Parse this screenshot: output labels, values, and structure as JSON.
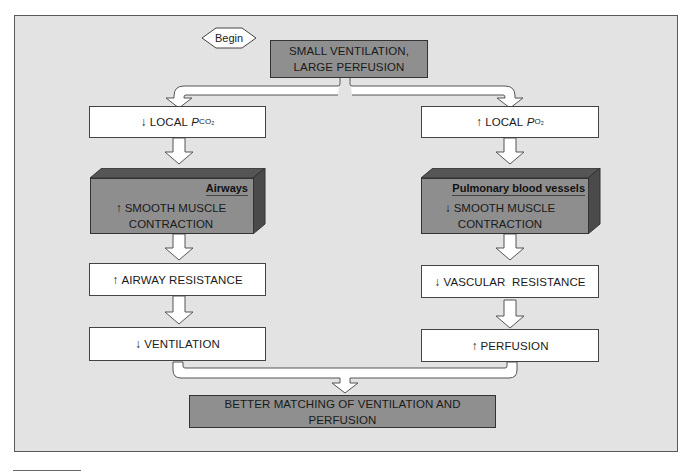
{
  "diagram": {
    "start": {
      "label": "Begin"
    },
    "top_box": {
      "line1": "SMALL VENTILATION,",
      "line2": "LARGE PERFUSION"
    },
    "left_column": {
      "local": {
        "arrow": "down",
        "text": "LOCAL ",
        "var": "P",
        "sub": "CO₂"
      },
      "tissue": {
        "header": "Airways",
        "arrow": "up",
        "line1": "SMOOTH MUSCLE",
        "line2": "CONTRACTION"
      },
      "resistance": {
        "arrow": "up",
        "text": "AIRWAY RESISTANCE"
      },
      "outcome": {
        "arrow": "down",
        "text": "VENTILATION"
      }
    },
    "right_column": {
      "local": {
        "arrow": "up",
        "text": "LOCAL ",
        "var": "P",
        "sub": "O₂"
      },
      "tissue": {
        "header": "Pulmonary blood vessels",
        "arrow": "down",
        "line1": "SMOOTH MUSCLE",
        "line2": "CONTRACTION"
      },
      "resistance": {
        "arrow": "down",
        "text": "VASCULAR  RESISTANCE"
      },
      "outcome": {
        "arrow": "up",
        "text": "PERFUSION"
      }
    },
    "result_box": {
      "text": "BETTER MATCHING OF VENTILATION AND PERFUSION"
    },
    "glyphs": {
      "up": "↑",
      "down": "↓"
    },
    "colors": {
      "panel": "#e3e3e3",
      "dark_box": "#8f8f8f",
      "white_box": "#ffffff",
      "box_top": "#555555",
      "box_side": "#4a4a4a"
    }
  }
}
